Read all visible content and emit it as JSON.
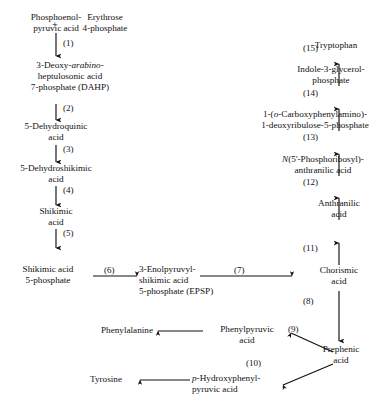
{
  "diagram": {
    "ink_color": "#111111",
    "background_color": "#ffffff",
    "nodes": {
      "pep": {
        "line1": "Phosphoenol-",
        "line2": "pyruvic acid"
      },
      "erythrose": {
        "line1": "Erythrose",
        "line2": "4-phosphate"
      },
      "plus": "+",
      "dahp": {
        "line1_a": "3-Deoxy-",
        "line1_italic": "arabino",
        "line1_b": "-",
        "line2": "heptulosonic acid",
        "line3": "7-phosphate  (DAHP)"
      },
      "dehydroquinic": {
        "line1": "5-Dehydroquinic",
        "line2": "acid"
      },
      "dehydroshikimic": {
        "line1": "5-Dehydroshikimic",
        "line2": "acid"
      },
      "shikimic": {
        "line1": "Shikimic",
        "line2": "acid"
      },
      "shikimic_5p": {
        "line1": "Shikimic acid",
        "line2": "5-phosphate"
      },
      "epsp": {
        "line1": "3-Enolpyruvyl-",
        "line2": "shikimic acid",
        "line3": "5-phosphate  (EPSP)"
      },
      "chorismic": {
        "line1": "Chorismic",
        "line2": "acid"
      },
      "anthranilic": {
        "line1": "Anthranilic",
        "line2": "acid"
      },
      "phosphoribosyl_anthranilic": {
        "line1_a": "N",
        "line1_b": "(5'-Phosphoribosyl)-",
        "line2": "anthranilic acid"
      },
      "carboxyphenylamino": {
        "line1_a": "1-(",
        "line1_italic": "o",
        "line1_b": "-Carboxyphenylamino)-",
        "line2": "1-deoxyribulose-5-phosphate"
      },
      "indole_glycerol": {
        "line1": "Indole-3-glycerol-",
        "line2": "phosphate"
      },
      "tryptophan": {
        "line1": "Tryptophan"
      },
      "prephenic": {
        "line1": "Prephenic",
        "line2": "acid"
      },
      "phenylpyruvic": {
        "line1": "Phenylpyruvic",
        "line2": "acid"
      },
      "phenylalanine": {
        "line1": "Phenylalanine"
      },
      "hydroxyphenylpyruvic": {
        "line1_italic": "p",
        "line1_b": "-Hydroxyphenyl-",
        "line2": "pyruvic acid"
      },
      "tyrosine": {
        "line1": "Tyrosine"
      }
    },
    "steps": [
      {
        "id": "s1",
        "label": "(1)"
      },
      {
        "id": "s2",
        "label": "(2)"
      },
      {
        "id": "s3",
        "label": "(3)"
      },
      {
        "id": "s4",
        "label": "(4)"
      },
      {
        "id": "s5",
        "label": "(5)"
      },
      {
        "id": "s6",
        "label": "(6)"
      },
      {
        "id": "s7",
        "label": "(7)"
      },
      {
        "id": "s8",
        "label": "(8)"
      },
      {
        "id": "s9",
        "label": "(9)"
      },
      {
        "id": "s10",
        "label": "(10)"
      },
      {
        "id": "s11",
        "label": "(11)"
      },
      {
        "id": "s12",
        "label": "(12)"
      },
      {
        "id": "s13",
        "label": "(13)"
      },
      {
        "id": "s14",
        "label": "(14)"
      },
      {
        "id": "s15",
        "label": "(15)"
      }
    ]
  }
}
